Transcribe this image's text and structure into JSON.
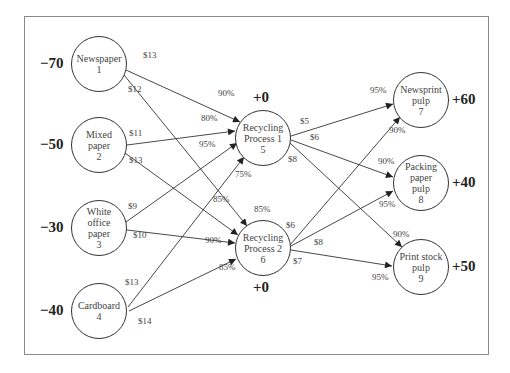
{
  "diagram": {
    "type": "generalized network flow (recycling)",
    "nodes": [
      {
        "id": 1,
        "line1": "Newspaper",
        "line2": "1",
        "line3": "",
        "line4": "",
        "net": "−70",
        "x": 99,
        "y": 64
      },
      {
        "id": 2,
        "line1": "Mixed",
        "line2": "paper",
        "line3": "2",
        "line4": "",
        "net": "−50",
        "x": 99,
        "y": 145
      },
      {
        "id": 3,
        "line1": "White",
        "line2": "office",
        "line3": "paper",
        "line4": "3",
        "net": "−30",
        "x": 99,
        "y": 228
      },
      {
        "id": 4,
        "line1": "Cardboard",
        "line2": "4",
        "line3": "",
        "line4": "",
        "net": "−40",
        "x": 99,
        "y": 311
      },
      {
        "id": 5,
        "line1": "Recycling",
        "line2": "Process 1",
        "line3": "5",
        "line4": "",
        "net": "+0",
        "x": 263,
        "y": 138
      },
      {
        "id": 6,
        "line1": "Recycling",
        "line2": "Process 2",
        "line3": "6",
        "line4": "",
        "net": "+0",
        "x": 263,
        "y": 248
      },
      {
        "id": 7,
        "line1": "Newsprint",
        "line2": "pulp",
        "line3": "7",
        "line4": "",
        "net": "+60",
        "x": 420,
        "y": 100
      },
      {
        "id": 8,
        "line1": "Packing",
        "line2": "paper",
        "line3": "pulp",
        "line4": "8",
        "net": "+40",
        "x": 420,
        "y": 183
      },
      {
        "id": 9,
        "line1": "Print stock",
        "line2": "pulp",
        "line3": "9",
        "line4": "",
        "net": "+50",
        "x": 420,
        "y": 267
      }
    ],
    "arcs": [
      {
        "from": 1,
        "to": 5,
        "cost": "$13",
        "yield": "90%"
      },
      {
        "from": 1,
        "to": 6,
        "cost": "$12",
        "yield": "85%"
      },
      {
        "from": 2,
        "to": 5,
        "cost": "$11",
        "yield": "80%"
      },
      {
        "from": 2,
        "to": 6,
        "cost": "$13",
        "yield": "85%"
      },
      {
        "from": 3,
        "to": 5,
        "cost": "$9",
        "yield": "95%"
      },
      {
        "from": 3,
        "to": 6,
        "cost": "$10",
        "yield": "90%"
      },
      {
        "from": 4,
        "to": 5,
        "cost": "$13",
        "yield": "75%"
      },
      {
        "from": 4,
        "to": 6,
        "cost": "$14",
        "yield": "85%"
      },
      {
        "from": 5,
        "to": 7,
        "cost": "$5",
        "yield": "95%"
      },
      {
        "from": 5,
        "to": 8,
        "cost": "$6",
        "yield": "90%"
      },
      {
        "from": 5,
        "to": 9,
        "cost": "$8",
        "yield": "90%"
      },
      {
        "from": 6,
        "to": 7,
        "cost": "$6",
        "yield": "90%"
      },
      {
        "from": 6,
        "to": 8,
        "cost": "$8",
        "yield": "95%"
      },
      {
        "from": 6,
        "to": 9,
        "cost": "$7",
        "yield": "95%"
      }
    ]
  },
  "labels": {
    "net": {
      "n1": "−70",
      "n2": "−50",
      "n3": "−30",
      "n4": "−40",
      "n5": "+0",
      "n6": "+0",
      "n7": "+60",
      "n8": "+40",
      "n9": "+50"
    },
    "costs": {
      "c15": "$13",
      "c16": "$12",
      "c25": "$11",
      "c26": "$13",
      "c35": "$9",
      "c36": "$10",
      "c45": "$13",
      "c46": "$14",
      "c57": "$5",
      "c58": "$6",
      "c59": "$8",
      "c67": "$6",
      "c68": "$8",
      "c69": "$7"
    },
    "yields": {
      "y15": "90%",
      "y16": "85%",
      "y25": "80%",
      "y26": "85%",
      "y35": "95%",
      "y36": "90%",
      "y45": "75%",
      "y46": "85%",
      "y57": "95%",
      "y58": "90%",
      "y59": "90%",
      "y67": "90%",
      "y68": "95%",
      "y69": "95%"
    }
  }
}
